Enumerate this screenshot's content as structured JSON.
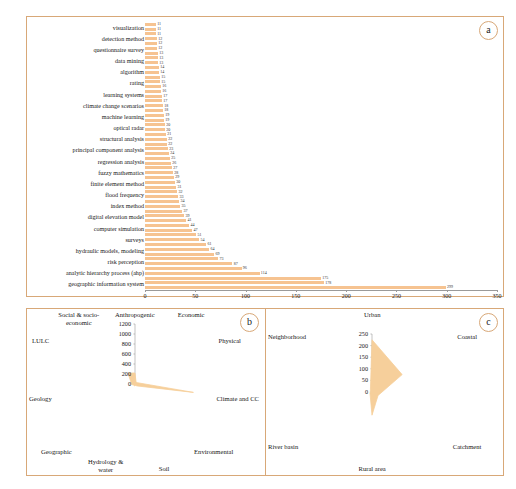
{
  "figure": {
    "background": "#ffffff",
    "frame_color": "#d8a878",
    "bar_color": "#f6c391",
    "radar_fill": "#f6cf9b"
  },
  "panels": {
    "a": {
      "badge": "a"
    },
    "b": {
      "badge": "b"
    },
    "c": {
      "badge": "c"
    }
  },
  "chart_data": [
    {
      "type": "bar",
      "orientation": "horizontal",
      "panel": "a",
      "title": "",
      "xlabel": "",
      "ylabel": "",
      "xlim": [
        0,
        350
      ],
      "xticks": [
        0,
        50,
        100,
        150,
        200,
        250,
        300,
        350
      ],
      "grid": false,
      "categories": [
        "visualization",
        "detection method",
        "questionnaire survey",
        "data mining",
        "algorithm",
        "rating",
        "learning systems",
        "climate change scenarios",
        "machine learning",
        "optical radar",
        "structural analysis",
        "principal component analysis",
        "regression analysis",
        "fuzzy mathematics",
        "finite element method",
        "flood frequency",
        "index method",
        "digital elevation model",
        "computer simulation",
        "surveys",
        "hydraulic models, modeling",
        "risk perception",
        "analytic hierarchy process (ahp)",
        "geographic information system"
      ],
      "labeled_categories_full": [
        "visualization",
        "detection method",
        "questionnaire survey",
        "data mining",
        "algorithm",
        "rating",
        "learning systems",
        "climate change scenarios",
        "machine learning",
        "optical radar",
        "structural analysis",
        "principal component analysis",
        "regression analysis",
        "fuzzy mathematics",
        "finite element method",
        "flood frequency",
        "index method",
        "digital elevation model",
        "computer simulation",
        "surveys",
        "hydraulic models, modeling",
        "risk perception",
        "analytic hierarchy process (ahp)",
        "geographic information system"
      ],
      "values": [
        11,
        11,
        11,
        12,
        12,
        12,
        13,
        13,
        13,
        14,
        14,
        15,
        15,
        16,
        16,
        17,
        17,
        18,
        18,
        19,
        19,
        20,
        20,
        21,
        22,
        22,
        23,
        24,
        25,
        26,
        27,
        28,
        29,
        30,
        31,
        32,
        33,
        34,
        35,
        37,
        39,
        41,
        44,
        47,
        51,
        54,
        61,
        64,
        69,
        73,
        87,
        96,
        114,
        175,
        178,
        299
      ],
      "annotated_values": [
        61,
        64,
        69,
        73,
        87,
        96,
        114,
        175,
        178,
        299
      ],
      "n_bars": 56
    },
    {
      "type": "radar",
      "panel": "b",
      "title": "",
      "rlim": [
        0,
        1200
      ],
      "rticks": [
        0,
        200,
        400,
        600,
        800,
        1000,
        1200
      ],
      "categories": [
        "Anthropogenic",
        "Economic",
        "Physical",
        "Climate and CC",
        "Environmental",
        "Soil",
        "Hydrology & water",
        "Geographic",
        "Geology",
        "LULC",
        "Social & socio-economic"
      ],
      "values": [
        220,
        40,
        60,
        1180,
        60,
        30,
        40,
        30,
        70,
        90,
        260
      ],
      "legend": ""
    },
    {
      "type": "radar",
      "panel": "c",
      "title": "",
      "rlim": [
        0,
        250
      ],
      "rticks": [
        0,
        50,
        100,
        150,
        200,
        250
      ],
      "categories": [
        "Urban",
        "Coastal",
        "Catchment",
        "Rural area",
        "River basin",
        "Neighborhood"
      ],
      "values": [
        225,
        150,
        30,
        100,
        10,
        8
      ],
      "legend": ""
    }
  ]
}
